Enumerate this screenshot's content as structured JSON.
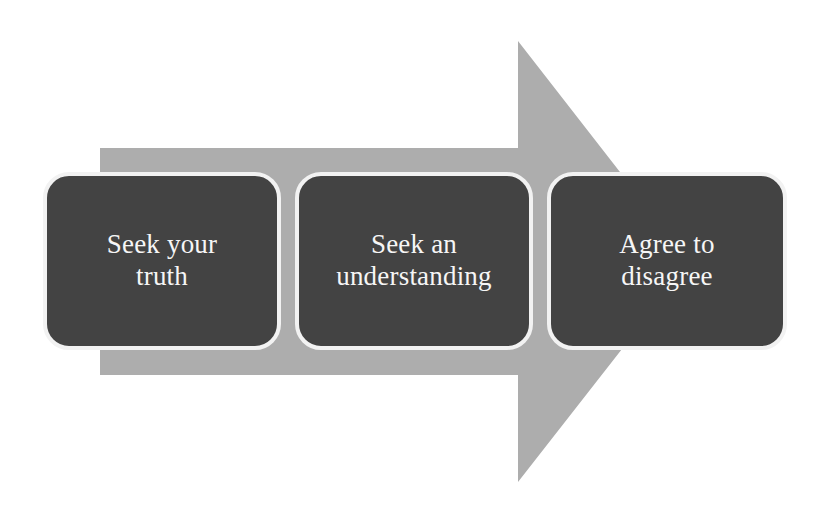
{
  "diagram": {
    "type": "process-arrow",
    "orientation": "left-to-right",
    "background_color": "#ffffff",
    "arrow": {
      "name": "right-pointing-block-arrow",
      "fill_color": "#ADADAD",
      "direction": "right"
    },
    "steps": [
      {
        "index": 1,
        "label": "Seek your\ntruth",
        "box_color": "#434343",
        "border_color": "#F2F2F2",
        "text_color": "#F6F6F6"
      },
      {
        "index": 2,
        "label": "Seek an\nunderstanding",
        "box_color": "#434343",
        "border_color": "#F2F2F2",
        "text_color": "#F6F6F6"
      },
      {
        "index": 3,
        "label": "Agree to\ndisagree",
        "box_color": "#434343",
        "border_color": "#F2F2F2",
        "text_color": "#F6F6F6"
      }
    ]
  }
}
